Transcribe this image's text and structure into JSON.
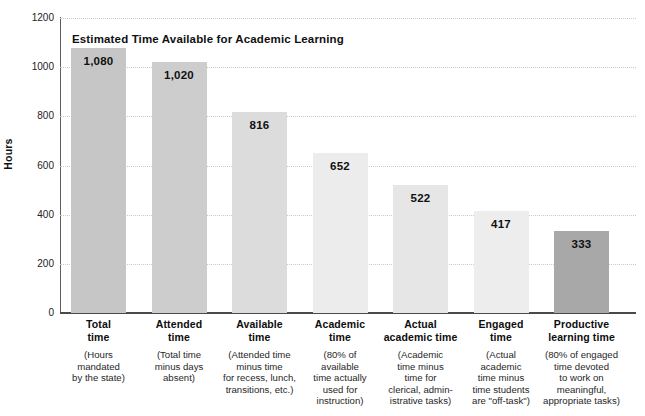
{
  "chart_data": {
    "type": "bar",
    "title": "Estimated Time Available for Academic Learning",
    "xlabel": "",
    "ylabel": "Hours",
    "ylim": [
      0,
      1200
    ],
    "grid": true,
    "legend": "none",
    "yticks": [
      0,
      200,
      400,
      600,
      800,
      1000,
      1200
    ],
    "ytick_labels": [
      "0",
      "200",
      "400",
      "600",
      "800",
      "1000",
      "1200"
    ],
    "categories": [
      "Total time",
      "Attended time",
      "Available time",
      "Academic time",
      "Actual academic time",
      "Engaged time",
      "Productive learning time"
    ],
    "values": [
      1080,
      1020,
      816,
      652,
      522,
      417,
      333
    ],
    "value_labels": [
      "1,080",
      "1,020",
      "816",
      "652",
      "522",
      "417",
      "333"
    ],
    "bars": [
      {
        "name_lines": [
          "Total",
          "time"
        ],
        "desc_lines": [
          "(Hours",
          "mandated",
          "by the state)"
        ],
        "value": 1080,
        "value_label": "1,080",
        "color": "#c6c6c6"
      },
      {
        "name_lines": [
          "Attended",
          "time"
        ],
        "desc_lines": [
          "(Total time",
          "minus days",
          "absent)"
        ],
        "value": 1020,
        "value_label": "1,020",
        "color": "#cdcdcd"
      },
      {
        "name_lines": [
          "Available",
          "time"
        ],
        "desc_lines": [
          "(Attended time",
          "minus time",
          "for recess, lunch,",
          "transitions, etc.)"
        ],
        "value": 816,
        "value_label": "816",
        "color": "#dcdcdc"
      },
      {
        "name_lines": [
          "Academic",
          "time"
        ],
        "desc_lines": [
          "(80% of",
          "available",
          "time actually",
          "used for",
          "instruction)"
        ],
        "value": 652,
        "value_label": "652",
        "color": "#ececec"
      },
      {
        "name_lines": [
          "Actual",
          "academic time"
        ],
        "desc_lines": [
          "(Academic",
          "time minus",
          "time for",
          "clerical, admin-",
          "istrative tasks)"
        ],
        "value": 522,
        "value_label": "522",
        "color": "#e6e6e6"
      },
      {
        "name_lines": [
          "Engaged",
          "time"
        ],
        "desc_lines": [
          "(Actual",
          "academic",
          "time minus",
          "time students",
          "are \"off-task\")"
        ],
        "value": 417,
        "value_label": "417",
        "color": "#ededed"
      },
      {
        "name_lines": [
          "Productive",
          "learning time"
        ],
        "desc_lines": [
          "(80% of engaged",
          "time devoted",
          "to work on",
          "meaningful,",
          "appropriate tasks)"
        ],
        "value": 333,
        "value_label": "333",
        "color": "#a8a8a8"
      }
    ],
    "colors": {
      "axis": "#4a4a4a",
      "grid": "#c9c9c9",
      "text": "#111111",
      "background": "#ffffff"
    }
  }
}
